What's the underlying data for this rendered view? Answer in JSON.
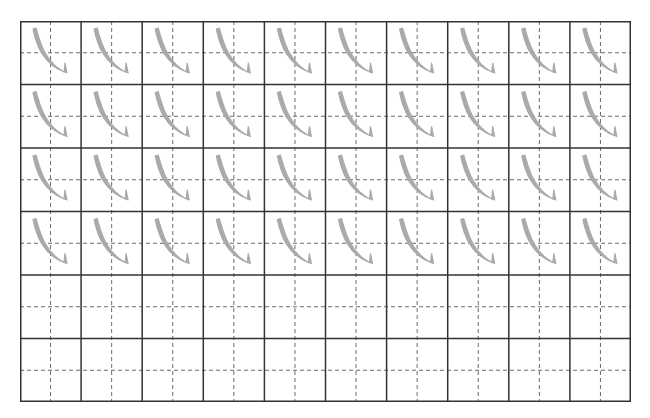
{
  "worksheet": {
    "title": "",
    "grid": {
      "columns": 10,
      "rows": 6,
      "traced_rows": 4,
      "blank_rows": 2,
      "cell_width": 61.1,
      "cell_height": 63.5
    },
    "character": {
      "name": "卧钩-style curved hook stroke",
      "glyph": "㇂"
    },
    "colors": {
      "background": "#ffffff",
      "grid_line": "#333333",
      "guide_line": "#6a6a6a",
      "trace_stroke": "#aaaaaa"
    }
  }
}
